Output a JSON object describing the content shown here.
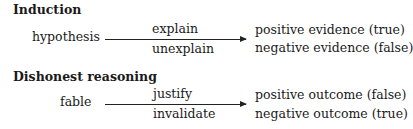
{
  "sections": [
    {
      "title": "Induction",
      "source": "hypothesis",
      "arrow_above": "explain",
      "arrow_below": "unexplain",
      "target_top": "positive evidence (true)",
      "target_bottom": "negative evidence (false)"
    },
    {
      "title": "Dishonest reasoning",
      "source": "fable",
      "arrow_above": "justify",
      "arrow_below": "invalidate",
      "target_top": "positive outcome (false)",
      "target_bottom": "negative outcome (true)"
    }
  ]
}
